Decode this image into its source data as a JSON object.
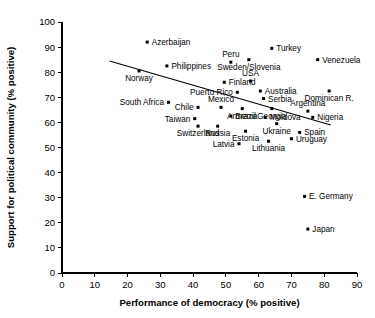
{
  "chart_data": {
    "type": "scatter",
    "title": "",
    "xlabel": "Performance of democracy (% positive)",
    "ylabel": "Support for political community (% positive)",
    "xlim": [
      0,
      90
    ],
    "ylim": [
      0,
      100
    ],
    "xticks": [
      0,
      10,
      20,
      30,
      40,
      50,
      60,
      70,
      80,
      90
    ],
    "yticks": [
      0,
      10,
      20,
      30,
      40,
      50,
      60,
      70,
      80,
      90,
      100
    ],
    "grid": false,
    "legend": null,
    "trend_line": {
      "label": "regression line",
      "x": [
        14.5,
        82.0
      ],
      "y": [
        84.5,
        59.0
      ]
    },
    "points": [
      {
        "name": "Azerbaijan",
        "x": 26.0,
        "y": 92.0,
        "label_side": "right"
      },
      {
        "name": "Turkey",
        "x": 64.0,
        "y": 89.5,
        "label_side": "right"
      },
      {
        "name": "Peru",
        "x": 51.5,
        "y": 84.0,
        "label_side": "above"
      },
      {
        "name": "Philippines",
        "x": 32.0,
        "y": 82.5,
        "label_side": "right"
      },
      {
        "name": "Venezuela",
        "x": 78.0,
        "y": 85.0,
        "label_side": "right"
      },
      {
        "name": "Sweden/Slovenia",
        "x": 57.0,
        "y": 85.0,
        "label_side": "below"
      },
      {
        "name": "Norway",
        "x": 23.5,
        "y": 80.5,
        "label_side": "below"
      },
      {
        "name": "Finland",
        "x": 49.5,
        "y": 76.0,
        "label_side": "right"
      },
      {
        "name": "USA",
        "x": 57.5,
        "y": 76.5,
        "label_side": "above"
      },
      {
        "name": "Australia",
        "x": 60.5,
        "y": 72.5,
        "label_side": "right"
      },
      {
        "name": "Dominican R.",
        "x": 81.5,
        "y": 72.5,
        "label_side": "below"
      },
      {
        "name": "Puerto Rico",
        "x": 53.5,
        "y": 72.0,
        "label_side": "left"
      },
      {
        "name": "Serbia",
        "x": 61.5,
        "y": 69.5,
        "label_side": "right"
      },
      {
        "name": "South Africa",
        "x": 32.5,
        "y": 68.0,
        "label_side": "left"
      },
      {
        "name": "Chile",
        "x": 41.5,
        "y": 66.0,
        "label_side": "left"
      },
      {
        "name": "Mexico",
        "x": 48.5,
        "y": 66.0,
        "label_side": "above"
      },
      {
        "name": "Armenia",
        "x": 55.0,
        "y": 65.5,
        "label_side": "below"
      },
      {
        "name": "Georgia",
        "x": 64.0,
        "y": 65.5,
        "label_side": "below"
      },
      {
        "name": "Argentina",
        "x": 75.0,
        "y": 64.5,
        "label_side": "above"
      },
      {
        "name": "Taiwan",
        "x": 40.5,
        "y": 61.5,
        "label_side": "left"
      },
      {
        "name": "Brazil",
        "x": 51.5,
        "y": 62.5,
        "label_side": "right"
      },
      {
        "name": "Moldova",
        "x": 62.0,
        "y": 62.0,
        "label_side": "right"
      },
      {
        "name": "Nigeria",
        "x": 76.5,
        "y": 62.0,
        "label_side": "right"
      },
      {
        "name": "Switzerland",
        "x": 41.5,
        "y": 58.5,
        "label_side": "below"
      },
      {
        "name": "Russia",
        "x": 47.5,
        "y": 58.5,
        "label_side": "below"
      },
      {
        "name": "Ukraine",
        "x": 65.5,
        "y": 59.5,
        "label_side": "below"
      },
      {
        "name": "Spain",
        "x": 72.5,
        "y": 56.0,
        "label_side": "right"
      },
      {
        "name": "Estonia",
        "x": 56.0,
        "y": 56.5,
        "label_side": "below"
      },
      {
        "name": "Uruguay",
        "x": 70.0,
        "y": 53.5,
        "label_side": "right"
      },
      {
        "name": "Latvia",
        "x": 54.0,
        "y": 51.5,
        "label_side": "left"
      },
      {
        "name": "Lithuania",
        "x": 63.0,
        "y": 52.5,
        "label_side": "below"
      },
      {
        "name": "E. Germany",
        "x": 74.0,
        "y": 30.5,
        "label_side": "right"
      },
      {
        "name": "Japan",
        "x": 75.0,
        "y": 17.5,
        "label_side": "right"
      }
    ]
  }
}
